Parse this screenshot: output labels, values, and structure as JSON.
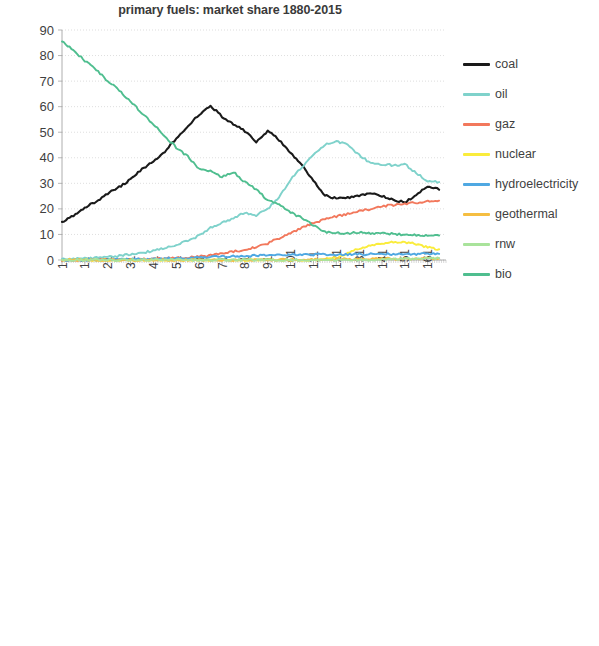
{
  "page": {
    "background": "#ffffff",
    "width": 599,
    "height": 646
  },
  "series_colors": {
    "coal": "#1a1a1a",
    "oil": "#7FD2CB",
    "gaz": "#F2785C",
    "nuclear": "#FAEC3C",
    "hydroelectricity": "#4FA8E2",
    "geothermal": "#F5BE41",
    "rnw": "#A9E39B",
    "bio": "#4FBE8F"
  },
  "legend": {
    "position": "right",
    "items": [
      {
        "label": "coal",
        "color": "#1a1a1a"
      },
      {
        "label": "oil",
        "color": "#7FD2CB"
      },
      {
        "label": "gaz",
        "color": "#F2785C"
      },
      {
        "label": "nuclear",
        "color": "#FAEC3C"
      },
      {
        "label": "hydroelectricity",
        "color": "#4FA8E2"
      },
      {
        "label": "geothermal",
        "color": "#F5BE41"
      },
      {
        "label": "rnw",
        "color": "#A9E39B"
      },
      {
        "label": "bio",
        "color": "#4FBE8F"
      }
    ]
  },
  "chart_data": [
    {
      "id": "linear",
      "type": "line",
      "title": "primary fuels: market share 1880-2015",
      "xlabel": "",
      "ylabel": "",
      "scale": "linear",
      "grid": true,
      "legend_position": "right",
      "xlim": [
        1,
        169
      ],
      "ylim": [
        0,
        90
      ],
      "yticks": [
        0,
        10,
        20,
        30,
        40,
        50,
        60,
        70,
        80,
        90
      ],
      "xticks": [
        1,
        11,
        21,
        31,
        41,
        51,
        61,
        71,
        81,
        91,
        101,
        111,
        121,
        131,
        141,
        151,
        161
      ],
      "x": [
        1,
        6,
        11,
        16,
        21,
        26,
        31,
        36,
        41,
        46,
        51,
        56,
        61,
        66,
        71,
        76,
        81,
        86,
        91,
        96,
        101,
        106,
        111,
        116,
        121,
        126,
        131,
        136,
        141,
        146,
        151,
        156,
        161,
        166
      ],
      "series": [
        {
          "name": "coal",
          "color": "#1a1a1a",
          "values": [
            14.5,
            17.5,
            20.5,
            23.0,
            26.0,
            28.5,
            31.5,
            35.5,
            38.5,
            42.5,
            47.5,
            52.5,
            57.0,
            60.5,
            56.0,
            53.0,
            50.5,
            46.0,
            50.5,
            47.0,
            42.0,
            37.0,
            31.0,
            25.5,
            24.0,
            24.5,
            25.0,
            26.0,
            25.0,
            23.5,
            22.5,
            25.5,
            29.0,
            27.5
          ]
        },
        {
          "name": "oil",
          "color": "#7FD2CB",
          "values": [
            0.2,
            0.4,
            0.6,
            0.9,
            1.2,
            1.6,
            2.1,
            2.8,
            3.6,
            4.6,
            5.8,
            7.5,
            9.5,
            12.5,
            14.5,
            16.5,
            18.5,
            17.5,
            20.0,
            24.5,
            31.5,
            36.5,
            41.0,
            45.0,
            46.5,
            45.0,
            41.0,
            38.0,
            37.5,
            37.0,
            37.5,
            34.0,
            31.0,
            30.5
          ]
        },
        {
          "name": "gaz",
          "color": "#F2785C",
          "values": [
            0.0,
            0.0,
            0.0,
            0.0,
            0.1,
            0.2,
            0.3,
            0.4,
            0.5,
            0.6,
            0.8,
            1.0,
            1.3,
            1.8,
            2.6,
            3.3,
            4.0,
            5.0,
            6.5,
            8.5,
            10.5,
            12.5,
            14.5,
            16.0,
            17.0,
            18.0,
            19.0,
            20.0,
            21.0,
            21.5,
            22.0,
            22.5,
            23.0,
            23.2
          ]
        },
        {
          "name": "nuclear",
          "color": "#FAEC3C",
          "values": [
            0.0,
            0.0,
            0.0,
            0.0,
            0.0,
            0.0,
            0.0,
            0.0,
            0.0,
            0.0,
            0.0,
            0.0,
            0.0,
            0.0,
            0.0,
            0.0,
            0.0,
            0.0,
            0.0,
            0.0,
            0.0,
            0.0,
            0.1,
            0.3,
            1.0,
            2.8,
            4.5,
            5.8,
            6.5,
            6.9,
            7.0,
            6.2,
            5.0,
            4.2
          ]
        },
        {
          "name": "hydroelectricity",
          "color": "#4FA8E2",
          "values": [
            0.0,
            0.0,
            0.03,
            0.06,
            0.1,
            0.15,
            0.2,
            0.28,
            0.4,
            0.55,
            0.7,
            0.85,
            1.0,
            1.15,
            1.3,
            1.45,
            1.6,
            1.7,
            1.8,
            1.9,
            2.0,
            2.05,
            2.1,
            2.15,
            2.2,
            2.2,
            2.25,
            2.25,
            2.3,
            2.3,
            2.3,
            2.35,
            2.4,
            2.4
          ]
        },
        {
          "name": "geothermal",
          "color": "#F5BE41",
          "values": [
            0.0,
            0.0,
            0.0,
            0.0,
            0.0,
            0.0,
            0.0,
            0.0,
            0.0,
            0.0,
            0.0,
            0.0,
            0.0,
            0.001,
            0.003,
            0.01,
            0.02,
            0.04,
            0.07,
            0.09,
            0.1,
            0.15,
            0.2,
            0.25,
            0.3,
            0.35,
            0.4,
            0.45,
            0.48,
            0.5,
            0.5,
            0.52,
            0.55,
            0.6
          ]
        },
        {
          "name": "rnw",
          "color": "#A9E39B",
          "values": [
            0.0,
            0.0,
            0.0,
            0.0,
            0.0,
            0.0,
            0.0,
            0.0,
            0.0,
            0.0,
            0.0,
            0.0,
            0.0,
            0.0,
            0.0,
            0.0,
            0.0,
            0.0,
            0.0,
            0.0,
            0.0,
            0.0,
            0.0005,
            0.001,
            0.002,
            0.005,
            0.02,
            0.05,
            0.12,
            0.25,
            0.4,
            0.5,
            0.6,
            0.7
          ]
        },
        {
          "name": "bio",
          "color": "#4FBE8F",
          "values": [
            85.5,
            82.0,
            78.0,
            74.5,
            70.0,
            66.5,
            62.0,
            57.5,
            53.0,
            48.5,
            44.0,
            40.5,
            35.5,
            35.0,
            32.5,
            34.5,
            30.5,
            27.5,
            23.5,
            21.5,
            18.5,
            16.5,
            13.5,
            11.0,
            10.5,
            10.5,
            10.8,
            10.5,
            10.3,
            10.2,
            10.0,
            9.8,
            9.7,
            9.6
          ]
        }
      ]
    },
    {
      "id": "log",
      "type": "line",
      "title": "primary fuels: market share 1880-2015 (log scale)",
      "xlabel": "",
      "ylabel": "",
      "scale": "log",
      "grid": true,
      "legend_position": "right",
      "xlim": [
        1,
        169
      ],
      "ylim": [
        0.0001,
        100
      ],
      "yticks": [
        0.0001,
        0.001,
        0.01,
        0.1,
        1,
        10,
        100
      ],
      "ytick_labels": [
        "0.0001",
        "0.001",
        "0.01",
        "0.1",
        "1",
        "10",
        "100"
      ],
      "xticks": [
        1,
        12,
        23,
        34,
        45,
        56,
        67,
        78,
        89,
        100,
        111,
        122,
        133,
        144,
        155,
        166
      ],
      "x": [
        1,
        6,
        11,
        16,
        21,
        26,
        31,
        36,
        41,
        46,
        51,
        56,
        61,
        66,
        71,
        76,
        81,
        86,
        91,
        96,
        101,
        106,
        111,
        116,
        121,
        126,
        131,
        136,
        141,
        146,
        151,
        156,
        161,
        166
      ],
      "series": [
        {
          "name": "coal",
          "color": "#1a1a1a",
          "values": [
            14.5,
            17.5,
            20.5,
            23.0,
            26.0,
            28.5,
            31.5,
            35.5,
            38.5,
            42.5,
            47.5,
            52.5,
            57.0,
            60.5,
            56.0,
            53.0,
            50.5,
            46.0,
            50.5,
            47.0,
            42.0,
            37.0,
            31.0,
            25.5,
            24.0,
            24.5,
            25.0,
            26.0,
            25.0,
            23.5,
            22.5,
            25.5,
            29.0,
            27.5
          ]
        },
        {
          "name": "oil",
          "color": "#7FD2CB",
          "values": [
            0.018,
            0.055,
            0.1,
            0.12,
            0.22,
            0.42,
            0.75,
            1.3,
            2.1,
            3.0,
            4.5,
            7.0,
            9.5,
            12.5,
            14.5,
            16.5,
            18.5,
            17.5,
            20.0,
            24.5,
            31.5,
            36.5,
            41.0,
            45.0,
            46.5,
            45.0,
            41.0,
            38.0,
            37.5,
            37.0,
            37.5,
            34.0,
            31.0,
            30.5
          ]
        },
        {
          "name": "gaz",
          "color": "#F2785C",
          "values": [
            null,
            null,
            null,
            null,
            null,
            null,
            null,
            null,
            0.7,
            0.62,
            0.95,
            1.6,
            2.4,
            3.2,
            4.5,
            6.0,
            7.5,
            9.5,
            12.5,
            13.0,
            14.5,
            16.0,
            17.5,
            18.5,
            19.5,
            20.0,
            20.5,
            21.0,
            21.5,
            22.0,
            22.5,
            23.0,
            23.5,
            24.0
          ]
        },
        {
          "name": "nuclear",
          "color": "#FAEC3C",
          "values": [
            null,
            null,
            null,
            null,
            null,
            null,
            null,
            null,
            null,
            null,
            null,
            null,
            null,
            null,
            null,
            null,
            null,
            null,
            null,
            null,
            0.0006,
            0.004,
            0.04,
            0.35,
            1.6,
            3.5,
            5.2,
            6.2,
            6.8,
            6.9,
            6.8,
            6.0,
            4.8,
            4.1
          ]
        },
        {
          "name": "hydroelectricity",
          "color": "#4FA8E2",
          "values": [
            null,
            null,
            null,
            null,
            null,
            null,
            null,
            null,
            null,
            0.027,
            0.05,
            0.095,
            0.11,
            0.2,
            0.35,
            0.55,
            0.8,
            1.05,
            1.3,
            1.5,
            1.7,
            1.85,
            2.0,
            2.1,
            2.15,
            2.2,
            2.25,
            2.25,
            2.3,
            2.3,
            2.3,
            2.35,
            2.4,
            2.4
          ]
        },
        {
          "name": "geothermal",
          "color": "#F5BE41",
          "values": [
            null,
            null,
            null,
            null,
            null,
            null,
            null,
            null,
            null,
            null,
            null,
            null,
            null,
            0.0009,
            0.0012,
            0.0025,
            0.004,
            0.006,
            0.0095,
            0.024,
            0.055,
            0.075,
            0.09,
            0.13,
            0.21,
            0.3,
            0.37,
            0.44,
            0.48,
            0.5,
            0.5,
            0.52,
            0.55,
            0.6
          ]
        },
        {
          "name": "rnw",
          "color": "#A9E39B",
          "values": [
            null,
            null,
            null,
            null,
            null,
            null,
            null,
            null,
            null,
            null,
            null,
            null,
            null,
            null,
            null,
            null,
            null,
            null,
            null,
            null,
            null,
            null,
            0.0004,
            0.0007,
            0.0008,
            0.0012,
            0.006,
            0.03,
            0.1,
            0.22,
            0.35,
            0.45,
            0.58,
            0.8
          ]
        },
        {
          "name": "bio",
          "color": "#4FBE8F",
          "values": [
            85.5,
            82.0,
            78.0,
            74.5,
            70.0,
            66.5,
            62.0,
            57.5,
            53.0,
            48.5,
            44.0,
            40.5,
            35.5,
            35.0,
            32.5,
            34.5,
            30.5,
            27.5,
            23.5,
            21.5,
            18.5,
            16.5,
            13.5,
            11.0,
            10.5,
            10.5,
            10.8,
            10.5,
            10.3,
            10.2,
            10.0,
            9.8,
            9.7,
            9.6
          ]
        }
      ]
    }
  ]
}
